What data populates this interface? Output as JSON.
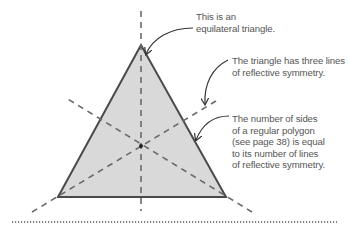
{
  "diagram": {
    "shape": "equilateral-triangle",
    "fill_color": "#d9d9d9",
    "stroke_color": "#4a4a4a",
    "symmetry_line_color": "#6a6a6a",
    "lines_of_symmetry": 3,
    "annotations": [
      {
        "id": "equilateral",
        "lines": [
          "This is an",
          "equilateral triangle."
        ]
      },
      {
        "id": "three-lines",
        "lines": [
          "The triangle has three lines",
          "of reflective symmetry."
        ]
      },
      {
        "id": "regular-polygon",
        "lines": [
          "The number of sides",
          "of a regular polygon",
          "(see page 38) is equal",
          "to its number of lines",
          "of reflective symmetry."
        ]
      }
    ]
  }
}
